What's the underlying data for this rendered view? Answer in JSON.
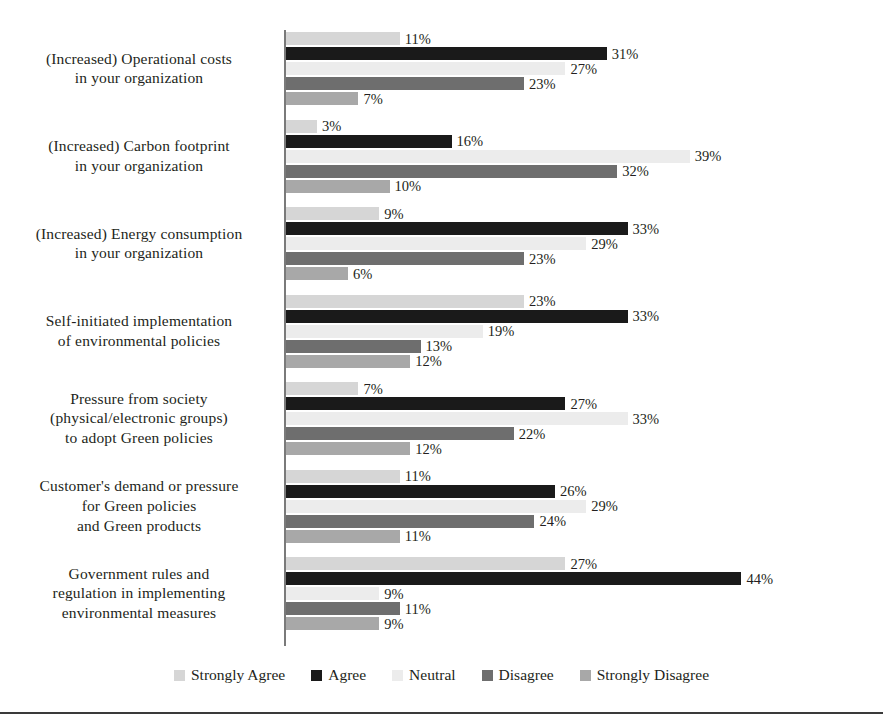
{
  "chart_data": {
    "type": "bar",
    "orientation": "horizontal",
    "grouped": true,
    "title": "",
    "subtitle": "",
    "xlabel": "",
    "ylabel": "",
    "xlim": [
      0,
      44
    ],
    "grid": false,
    "legend_position": "bottom",
    "value_suffix": "%",
    "categories": [
      "(Increased) Operational costs\nin your organization",
      "(Increased) Carbon footprint\nin your organization",
      "(Increased) Energy consumption\nin your organization",
      "Self-initiated implementation\nof environmental policies",
      "Pressure from society\n(physical/electronic groups)\nto adopt Green policies",
      "Customer's demand or pressure\nfor Green policies\nand Green products",
      "Government rules and\nregulation in implementing\nenvironmental measures"
    ],
    "series": [
      {
        "name": "Strongly Agree",
        "color": "#d6d6d6",
        "values": [
          11,
          3,
          9,
          23,
          7,
          11,
          27
        ]
      },
      {
        "name": "Agree",
        "color": "#1a1a1a",
        "values": [
          31,
          16,
          33,
          33,
          27,
          26,
          44
        ]
      },
      {
        "name": "Neutral",
        "color": "#ececec",
        "values": [
          27,
          39,
          29,
          19,
          33,
          29,
          9
        ]
      },
      {
        "name": "Disagree",
        "color": "#6e6e6e",
        "values": [
          23,
          32,
          23,
          13,
          22,
          24,
          11
        ]
      },
      {
        "name": "Strongly Disagree",
        "color": "#a8a8a8",
        "values": [
          7,
          10,
          6,
          12,
          12,
          11,
          9
        ]
      }
    ]
  },
  "categories_display": [
    {
      "lines": [
        "(Increased) Operational costs",
        "in your organization"
      ]
    },
    {
      "lines": [
        "(Increased) Carbon footprint",
        "in your organization"
      ]
    },
    {
      "lines": [
        "(Increased) Energy consumption",
        "in your organization"
      ]
    },
    {
      "lines": [
        "Self-initiated implementation",
        "of environmental policies"
      ]
    },
    {
      "lines": [
        "Pressure from society",
        "(physical/electronic groups)",
        "to adopt Green policies"
      ]
    },
    {
      "lines": [
        "Customer's demand or pressure",
        "for Green policies",
        "and Green products"
      ]
    },
    {
      "lines": [
        "Government rules and",
        "regulation in implementing",
        "environmental measures"
      ]
    }
  ],
  "legend": {
    "items": [
      {
        "label": "Strongly Agree",
        "color": "#d6d6d6"
      },
      {
        "label": "Agree",
        "color": "#1a1a1a"
      },
      {
        "label": "Neutral",
        "color": "#ececec"
      },
      {
        "label": "Disagree",
        "color": "#6e6e6e"
      },
      {
        "label": "Strongly Disagree",
        "color": "#a8a8a8"
      }
    ]
  },
  "axis": {
    "line_color": "#7a7a7a"
  },
  "style": {
    "background": "#ffffff",
    "text_color": "#231f20",
    "rule_color": "#3a3a3a"
  }
}
